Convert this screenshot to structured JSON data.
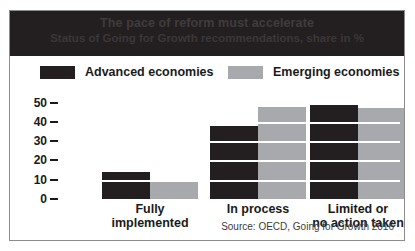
{
  "figure": {
    "title_main": "The pace of reform must accelerate",
    "title_sub": "Status of Going for Growth recommendations, share in %",
    "source": "Source: OECD, Going for Growth 2016"
  },
  "legend": {
    "items": [
      {
        "label": "Advanced economies",
        "color": "#231f20"
      },
      {
        "label": "Emerging economies",
        "color": "#a7a9ac"
      }
    ]
  },
  "colors": {
    "advanced": "#231f20",
    "emerging": "#a7a9ac",
    "banner": "#231f20",
    "frame": "#8d8d8d",
    "gridline": "#ffffff",
    "text": "#1a1a1a"
  },
  "yticks": [
    "50",
    "40",
    "30",
    "20",
    "10",
    "0"
  ],
  "chart_data": {
    "type": "bar",
    "title": "The pace of reform must accelerate",
    "subtitle": "Status of Going for Growth recommendations, share in %",
    "xlabel": "",
    "ylabel": "share in %",
    "ylim": [
      0,
      55
    ],
    "ytick_values": [
      0,
      10,
      20,
      30,
      40,
      50
    ],
    "grid": true,
    "legend_position": "top",
    "categories": [
      "Fully implemented",
      "In process",
      "Limited or no action taken"
    ],
    "category_lines": [
      [
        "Fully",
        "implemented"
      ],
      [
        "In process"
      ],
      [
        "Limited or",
        "no action taken"
      ]
    ],
    "series": [
      {
        "name": "Advanced economies",
        "color": "#231f20",
        "values": [
          14,
          38,
          50
        ]
      },
      {
        "name": "Emerging economies",
        "color": "#a7a9ac",
        "values": [
          9,
          48,
          47
        ]
      }
    ],
    "source": "Source: OECD, Going for Growth 2016"
  }
}
